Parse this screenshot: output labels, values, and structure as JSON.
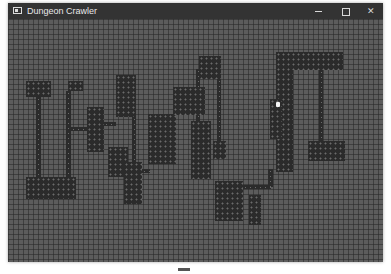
{
  "window": {
    "title": "Dungeon Crawler",
    "controls": {
      "minimize": "minimize",
      "maximize": "maximize",
      "close": "✕"
    }
  },
  "map": {
    "cell_size_px": 5,
    "colors": {
      "floor_bg": "#5c5c5c",
      "wall_dark": "#2b2b2b",
      "player": "#f4f4f4"
    },
    "rooms": [
      {
        "x": 18,
        "y": 62,
        "w": 25,
        "h": 16
      },
      {
        "x": 18,
        "y": 158,
        "w": 50,
        "h": 22
      },
      {
        "x": 60,
        "y": 62,
        "w": 15,
        "h": 10
      },
      {
        "x": 79,
        "y": 88,
        "w": 17,
        "h": 45
      },
      {
        "x": 108,
        "y": 56,
        "w": 20,
        "h": 42
      },
      {
        "x": 100,
        "y": 128,
        "w": 20,
        "h": 30
      },
      {
        "x": 116,
        "y": 143,
        "w": 18,
        "h": 42
      },
      {
        "x": 140,
        "y": 95,
        "w": 28,
        "h": 50
      },
      {
        "x": 165,
        "y": 68,
        "w": 32,
        "h": 28
      },
      {
        "x": 191,
        "y": 37,
        "w": 22,
        "h": 23
      },
      {
        "x": 183,
        "y": 102,
        "w": 20,
        "h": 58
      },
      {
        "x": 205,
        "y": 122,
        "w": 13,
        "h": 18
      },
      {
        "x": 207,
        "y": 162,
        "w": 28,
        "h": 40
      },
      {
        "x": 241,
        "y": 176,
        "w": 12,
        "h": 30
      },
      {
        "x": 268,
        "y": 33,
        "w": 67,
        "h": 18
      },
      {
        "x": 268,
        "y": 33,
        "w": 17,
        "h": 120
      },
      {
        "x": 262,
        "y": 80,
        "w": 12,
        "h": 40
      },
      {
        "x": 300,
        "y": 122,
        "w": 37,
        "h": 20
      }
    ],
    "corridors": [
      {
        "x": 28,
        "y": 78,
        "w": 5,
        "h": 82
      },
      {
        "x": 58,
        "y": 72,
        "w": 5,
        "h": 88
      },
      {
        "x": 63,
        "y": 108,
        "w": 17,
        "h": 4
      },
      {
        "x": 96,
        "y": 103,
        "w": 12,
        "h": 4
      },
      {
        "x": 124,
        "y": 98,
        "w": 4,
        "h": 46
      },
      {
        "x": 134,
        "y": 150,
        "w": 8,
        "h": 4
      },
      {
        "x": 188,
        "y": 50,
        "w": 4,
        "h": 54
      },
      {
        "x": 209,
        "y": 60,
        "w": 4,
        "h": 64
      },
      {
        "x": 235,
        "y": 166,
        "w": 28,
        "h": 4
      },
      {
        "x": 260,
        "y": 150,
        "w": 5,
        "h": 18
      },
      {
        "x": 311,
        "y": 51,
        "w": 4,
        "h": 72
      }
    ],
    "player": {
      "x": 268,
      "y": 83
    }
  }
}
